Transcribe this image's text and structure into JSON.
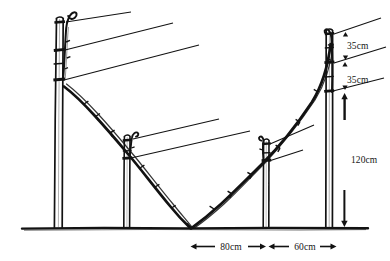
{
  "figure": {
    "ink_color": "#121212",
    "background_color": "#ffffff"
  },
  "dimensions": {
    "vertical": [
      {
        "id": "top-gap",
        "label": "35cm",
        "value": 35,
        "unit": "cm",
        "x": 343,
        "y": 46
      },
      {
        "id": "second-gap",
        "label": "35cm",
        "value": 35,
        "unit": "cm",
        "x": 343,
        "y": 80
      },
      {
        "id": "post-height",
        "label": "120cm",
        "value": 120,
        "unit": "cm",
        "x": 340,
        "y": 160
      }
    ],
    "horizontal": [
      {
        "id": "span-left",
        "label": "80cm",
        "value": 80,
        "unit": "cm",
        "x": 222,
        "y": 250
      },
      {
        "id": "span-right",
        "label": "60cm",
        "value": 60,
        "unit": "cm",
        "x": 307,
        "y": 250
      }
    ]
  },
  "structure": {
    "ground_line_y": 228,
    "posts": [
      {
        "id": "post-far-left",
        "x": 59,
        "top_y": 16,
        "height_class": "tall",
        "wire_attachments": 3
      },
      {
        "id": "post-mid-left",
        "x": 127,
        "top_y": 132,
        "height_class": "short",
        "wire_attachments": 2
      },
      {
        "id": "post-mid-right",
        "x": 266,
        "top_y": 136,
        "height_class": "short",
        "wire_attachments": 2
      },
      {
        "id": "post-far-right",
        "x": 329,
        "top_y": 28,
        "height_class": "tall",
        "wire_attachments": 3
      }
    ],
    "cane": {
      "id": "v-shaped-cane",
      "shape": "V",
      "apex_x": 190,
      "apex_y": 228,
      "left_origin": {
        "x": 66,
        "y": 90
      },
      "right_origin": {
        "x": 330,
        "y": 36
      }
    },
    "wires": [
      {
        "id": "wire-L1",
        "from_post": "post-far-left",
        "x1": 70,
        "y1": 22,
        "x2": 131,
        "y2": 12
      },
      {
        "id": "wire-L2",
        "from_post": "post-far-left",
        "x1": 68,
        "y1": 50,
        "x2": 173,
        "y2": 23
      },
      {
        "id": "wire-L3",
        "from_post": "post-far-left",
        "x1": 68,
        "y1": 80,
        "x2": 199,
        "y2": 45
      },
      {
        "id": "wire-M1",
        "from_post": "post-mid-left",
        "x1": 135,
        "y1": 138,
        "x2": 219,
        "y2": 119
      },
      {
        "id": "wire-M2",
        "from_post": "post-mid-left",
        "x1": 133,
        "y1": 158,
        "x2": 250,
        "y2": 131
      },
      {
        "id": "wire-N1",
        "from_post": "post-mid-right",
        "x1": 271,
        "y1": 141,
        "x2": 314,
        "y2": 125
      },
      {
        "id": "wire-N2",
        "from_post": "post-mid-right",
        "x1": 268,
        "y1": 160,
        "x2": 302,
        "y2": 150
      },
      {
        "id": "wire-R1",
        "from_post": "post-far-right",
        "x1": 336,
        "y1": 33,
        "x2": 381,
        "y2": 18
      },
      {
        "id": "wire-R2",
        "from_post": "post-far-right",
        "x1": 335,
        "y1": 62,
        "x2": 385,
        "y2": 47
      },
      {
        "id": "wire-R3",
        "from_post": "post-far-right",
        "x1": 334,
        "y1": 91,
        "x2": 383,
        "y2": 78
      }
    ]
  }
}
